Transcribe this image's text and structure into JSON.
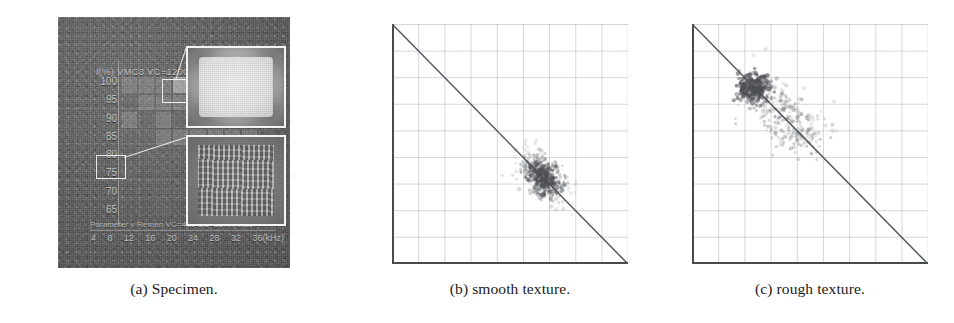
{
  "figure": {
    "panels": [
      {
        "key": "a",
        "caption": "(a) Specimen."
      },
      {
        "key": "b",
        "caption": "(b) smooth texture."
      },
      {
        "key": "c",
        "caption": "(c) rough texture."
      }
    ]
  },
  "specimen": {
    "header_text": "I(%) VMC3  VC=1200 l/",
    "y_axis_label_unit": "I(%)",
    "y_ticks": [
      "100",
      "95",
      "90",
      "85",
      "80",
      "75",
      "70",
      "65"
    ],
    "x_ticks": [
      "4",
      "8",
      "12",
      "16",
      "20",
      "24",
      "28",
      "32",
      "36(kHz)"
    ],
    "x_axis_unit": "kHz",
    "parameter_line": "Parameter  v  Remen  VC=400 1.5=35% f 0.15",
    "inset_top_name": "smooth-texture-inset",
    "inset_bottom_name": "rough-texture-inset",
    "selection_top_name": "selection-box-smooth",
    "selection_bottom_name": "selection-box-rough",
    "grid_columns": 9,
    "grid_rows": 8
  },
  "chart_data": [
    {
      "type": "scatter",
      "title": "(b) smooth texture.",
      "xlabel": "",
      "ylabel": "",
      "xlim": [
        0,
        9
      ],
      "ylim": [
        0,
        9
      ],
      "grid": true,
      "grid_columns": 9,
      "grid_rows": 9,
      "legend": "none",
      "annotations": [
        {
          "name": "identity-diagonal",
          "type": "line",
          "from": [
            0,
            9
          ],
          "to": [
            9,
            0
          ]
        }
      ],
      "cluster": {
        "name": "smooth-texture-cluster",
        "center": [
          5.75,
          3.25
        ],
        "spread_x": 0.55,
        "spread_y": 0.52,
        "n_points": 420,
        "density": "compact-dense",
        "color": "#4d5054"
      },
      "points_x": [
        5.75,
        5.62,
        5.9,
        5.5,
        6.0,
        5.4,
        6.1,
        5.8,
        5.68,
        5.95,
        5.3,
        6.2,
        5.55,
        5.85,
        6.05,
        5.45,
        5.72,
        5.98,
        5.35,
        6.15,
        5.6,
        5.88,
        6.08,
        5.48,
        5.78,
        5.25,
        6.25,
        5.65,
        5.92,
        6.02
      ],
      "points_y": [
        3.25,
        3.38,
        3.12,
        3.5,
        3.0,
        3.6,
        2.9,
        3.2,
        3.32,
        3.05,
        3.7,
        2.8,
        3.45,
        3.15,
        2.95,
        3.55,
        3.28,
        3.02,
        3.65,
        2.85,
        3.4,
        3.1,
        2.98,
        3.52,
        3.22,
        3.75,
        2.75,
        3.35,
        3.08,
        3.0
      ]
    },
    {
      "type": "scatter",
      "title": "(c) rough texture.",
      "xlabel": "",
      "ylabel": "",
      "xlim": [
        0,
        9
      ],
      "ylim": [
        0,
        9
      ],
      "grid": true,
      "grid_columns": 9,
      "grid_rows": 9,
      "legend": "none",
      "annotations": [
        {
          "name": "identity-diagonal",
          "type": "line",
          "from": [
            0,
            9
          ],
          "to": [
            9,
            0
          ]
        }
      ],
      "cluster": {
        "name": "rough-texture-cluster",
        "center": [
          2.55,
          6.35
        ],
        "spread_x": 1.25,
        "spread_y": 1.15,
        "n_points": 480,
        "density": "diffuse-with-dense-core",
        "core_center": [
          2.35,
          6.6
        ],
        "color": "#4d5054"
      },
      "points_x": [
        2.35,
        2.5,
        2.2,
        2.65,
        2.1,
        2.8,
        2.45,
        3.0,
        2.3,
        3.2,
        2.6,
        3.4,
        2.9,
        3.6,
        2.75,
        3.1,
        2.4,
        3.8,
        2.55,
        3.3,
        2.25,
        3.5,
        2.7,
        4.0,
        2.95,
        3.7,
        2.15,
        3.9,
        2.85,
        3.15
      ],
      "points_y": [
        6.6,
        6.45,
        6.7,
        6.3,
        6.8,
        6.1,
        6.5,
        5.9,
        6.65,
        5.7,
        6.35,
        5.5,
        6.0,
        5.3,
        6.15,
        5.85,
        6.55,
        5.0,
        6.4,
        5.6,
        6.75,
        5.35,
        6.25,
        4.8,
        5.95,
        5.2,
        6.85,
        4.95,
        6.05,
        5.75
      ]
    }
  ]
}
